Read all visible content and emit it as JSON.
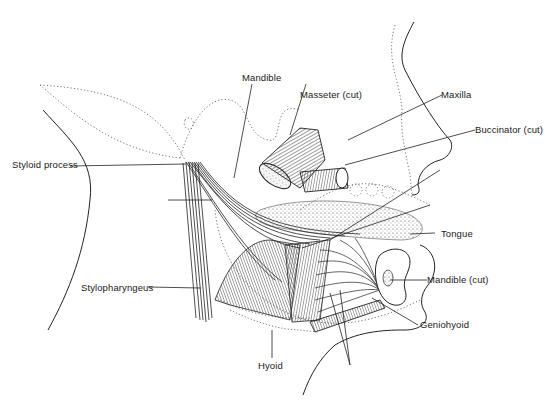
{
  "figure": {
    "type": "anatomical-illustration",
    "colors": {
      "ink": "#1a1a1a",
      "background": "#ffffff",
      "stipple": "#555555"
    }
  },
  "labels": {
    "mandible": "Mandible",
    "masseter_cut": "Masseter (cut)",
    "maxilla": "Maxilla",
    "buccinator_cut": "Buccinator (cut)",
    "styloid_process": "Styloid process",
    "tongue": "Tongue",
    "mandible_cut": "Mandible (cut)",
    "stylopharyngeus": "Stylopharyngeus",
    "geniohyoid": "Geniohyoid",
    "hyoid": "Hyoid"
  }
}
